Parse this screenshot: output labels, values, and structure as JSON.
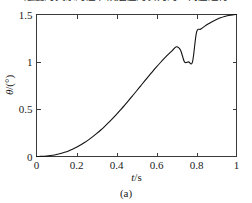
{
  "heading": {
    "clipped_text": "速度的关系的证书候选值的表为的一代值进行"
  },
  "figure": {
    "caption": "(a)"
  },
  "chart_data": {
    "type": "line",
    "title": "",
    "subtitle": "",
    "xlabel": "t/s",
    "xlabel_symbol": "t",
    "xlabel_unit": "s",
    "ylabel": "θ/(°)",
    "ylabel_symbol": "θ",
    "ylabel_unit": "(°)",
    "xlim": [
      0,
      1
    ],
    "ylim": [
      0,
      1.5
    ],
    "xticks": [
      0,
      0.2,
      0.4,
      0.6,
      0.8,
      1
    ],
    "xtick_labels": [
      "0",
      "0.2",
      "0.4",
      "0.6",
      "0.8",
      "1"
    ],
    "yticks": [
      0,
      0.5,
      1,
      1.5
    ],
    "ytick_labels": [
      "0",
      "0.5",
      "1",
      "1.5"
    ],
    "grid": false,
    "legend": null,
    "legend_position": "none",
    "tick_direction": "in",
    "box": true,
    "line_color": "#111111",
    "series": [
      {
        "name": "theta",
        "x": [
          0.0,
          0.02,
          0.04,
          0.06,
          0.08,
          0.1,
          0.12,
          0.14,
          0.16,
          0.18,
          0.2,
          0.22,
          0.24,
          0.26,
          0.28,
          0.3,
          0.32,
          0.34,
          0.36,
          0.38,
          0.4,
          0.42,
          0.44,
          0.46,
          0.48,
          0.5,
          0.52,
          0.54,
          0.56,
          0.58,
          0.6,
          0.62,
          0.64,
          0.66,
          0.68,
          0.7,
          0.72,
          0.74,
          0.76,
          0.78,
          0.8,
          0.82,
          0.84,
          0.86,
          0.88,
          0.9,
          0.92,
          0.94,
          0.96,
          0.98,
          1.0
        ],
        "y": [
          0.0,
          0.001,
          0.003,
          0.007,
          0.013,
          0.021,
          0.031,
          0.044,
          0.059,
          0.077,
          0.098,
          0.121,
          0.147,
          0.176,
          0.207,
          0.241,
          0.277,
          0.316,
          0.357,
          0.4,
          0.445,
          0.492,
          0.54,
          0.59,
          0.641,
          0.692,
          0.744,
          0.796,
          0.847,
          0.897,
          0.946,
          0.993,
          1.038,
          1.081,
          1.121,
          1.159,
          1.125,
          1.0,
          1.0,
          1.0,
          1.311,
          1.344,
          1.375,
          1.402,
          1.426,
          1.447,
          1.465,
          1.479,
          1.489,
          1.496,
          1.5
        ]
      }
    ],
    "annotations": []
  }
}
